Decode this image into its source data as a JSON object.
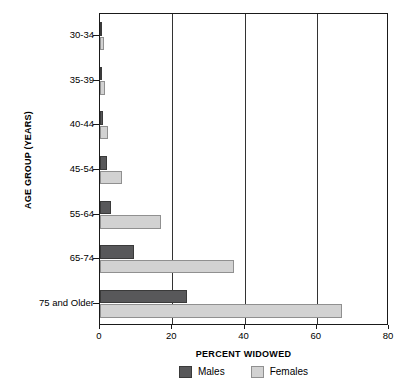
{
  "chart_data": {
    "type": "bar",
    "orientation": "horizontal",
    "title": "",
    "xlabel": "PERCENT WIDOWED",
    "ylabel": "AGE GROUP (YEARS)",
    "categories": [
      "30-34",
      "35-39",
      "40-44",
      "45-54",
      "55-64",
      "65-74",
      "75 and Older"
    ],
    "series": [
      {
        "name": "Males",
        "color": "#58585a",
        "values": [
          0.3,
          0.4,
          0.7,
          1.8,
          3.1,
          9.5,
          24.0
        ]
      },
      {
        "name": "Females",
        "color": "#d2d2d2",
        "values": [
          1.0,
          1.3,
          2.3,
          6.0,
          17.0,
          37.0,
          67.0
        ]
      }
    ],
    "xlim": [
      0,
      80
    ],
    "xticks": [
      0,
      20,
      40,
      60,
      80
    ],
    "xtick_labels": [
      "0",
      "20",
      "40",
      "60",
      "80"
    ],
    "grid": "vertical",
    "legend_position": "bottom"
  },
  "legend": {
    "items": [
      {
        "label": "Males",
        "color": "#58585a"
      },
      {
        "label": "Females",
        "color": "#d2d2d2"
      }
    ]
  },
  "axes": {
    "x_title": "PERCENT WIDOWED",
    "y_title": "AGE GROUP (YEARS)"
  }
}
